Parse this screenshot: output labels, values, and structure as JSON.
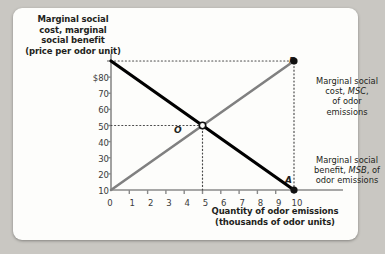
{
  "chart_data": {
    "type": "line",
    "title": "",
    "ylabel": "Marginal social cost, marginal social benefit (price per odor unit)",
    "xlabel": "Quantity of odor emissions (thousands of odor units)",
    "ylabel_lines": [
      "Marginal social",
      "cost, marginal",
      "social benefit",
      "(price per odor unit)"
    ],
    "xlabel_lines": [
      "Quantity of odor emissions",
      "(thousands of odor units)"
    ],
    "xlim": [
      0,
      10
    ],
    "ylim": [
      0,
      80
    ],
    "xticks": [
      "0",
      "1",
      "2",
      "3",
      "4",
      "5",
      "6",
      "7",
      "8",
      "9",
      "10"
    ],
    "yticks": [
      "$80",
      "70",
      "60",
      "50",
      "40",
      "30",
      "20",
      "10",
      "0"
    ],
    "ytick_values": [
      80,
      70,
      60,
      50,
      40,
      30,
      20,
      10,
      0
    ],
    "grid": false,
    "legend": "annotations",
    "series": [
      {
        "name": "Marginal social cost, MSC, of odor emissions",
        "short": "MSC",
        "color": "#808080",
        "points": [
          {
            "x": 0,
            "y": 0
          },
          {
            "x": 10,
            "y": 80
          }
        ]
      },
      {
        "name": "Marginal social benefit, MSB, of odor emissions",
        "short": "MSB",
        "color": "#000000",
        "points": [
          {
            "x": 0,
            "y": 80
          },
          {
            "x": 10,
            "y": 0
          }
        ]
      }
    ],
    "points": [
      {
        "label": "B",
        "x": 10,
        "y": 80
      },
      {
        "label": "O",
        "x": 5,
        "y": 40
      },
      {
        "label": "A",
        "x": 10,
        "y": 0
      }
    ],
    "guides": [
      {
        "type": "horizontal",
        "y": 80,
        "from_x": 0,
        "to_x": 10
      },
      {
        "type": "horizontal",
        "y": 40,
        "from_x": 0,
        "to_x": 5
      },
      {
        "type": "vertical",
        "x": 5,
        "from_y": 0,
        "to_y": 40
      },
      {
        "type": "vertical",
        "x": 10,
        "from_y": 0,
        "to_y": 80
      }
    ]
  },
  "annotations": {
    "msc": {
      "lines": [
        "Marginal social",
        "cost, MSC,",
        "of odor",
        "emissions"
      ],
      "l1": "Marginal social",
      "l2a": "cost, ",
      "l2b": "MSC",
      "l2c": ",",
      "l3": "of odor",
      "l4": "emissions"
    },
    "msb": {
      "lines": [
        "Marginal social",
        "benefit, MSB, of",
        "odor emissions"
      ],
      "l1": "Marginal social",
      "l2a": "benefit, ",
      "l2b": "MSB",
      "l2c": ", of",
      "l3": "odor emissions"
    }
  },
  "colors": {
    "msc_line": "#808080",
    "msb_line": "#000000",
    "axis": "#8a8a8a",
    "text": "#231f20",
    "card": "#fdfdfb",
    "page": "#c9c7c2"
  }
}
